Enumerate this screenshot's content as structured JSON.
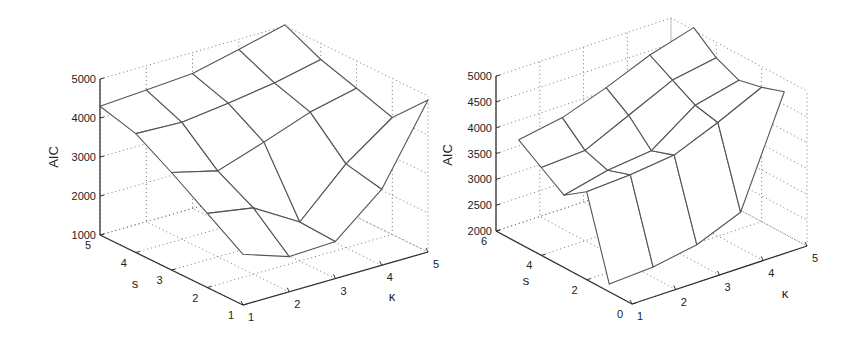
{
  "chart_data": [
    {
      "type": "surface3d",
      "title": "",
      "xlabel": "κ",
      "ylabel": "s",
      "zlabel": "AIC",
      "x": [
        1,
        2,
        3,
        4,
        5
      ],
      "y": [
        1,
        2,
        3,
        4,
        5
      ],
      "xlim": [
        1,
        5
      ],
      "ylim": [
        1,
        5
      ],
      "zlim": [
        1000,
        5000
      ],
      "x_ticks": [
        1,
        2,
        3,
        4,
        5
      ],
      "y_ticks": [
        1,
        2,
        3,
        4,
        5
      ],
      "z_ticks": [
        1000,
        2000,
        3000,
        4000,
        5000
      ],
      "grid": true,
      "z_values_by_s": [
        [
          2300,
          1900,
          1950,
          2950,
          4900
        ],
        [
          2900,
          2700,
          2000,
          3150,
          4000
        ],
        [
          3500,
          3200,
          3600,
          4030,
          4300
        ],
        [
          4050,
          4000,
          4150,
          4330,
          4590
        ],
        [
          4300,
          4380,
          4460,
          4740,
          5030
        ]
      ]
    },
    {
      "type": "surface3d",
      "title": "",
      "xlabel": "κ",
      "ylabel": "s",
      "zlabel": "AIC",
      "x": [
        1,
        2,
        3,
        4,
        5
      ],
      "y": [
        1,
        2,
        3,
        4,
        5
      ],
      "xlim": [
        1,
        5
      ],
      "ylim": [
        0,
        6
      ],
      "zlim": [
        2000,
        5000
      ],
      "x_ticks": [
        1,
        2,
        3,
        4,
        5
      ],
      "y_ticks": [
        0,
        2,
        4,
        6
      ],
      "z_ticks": [
        2000,
        2500,
        3000,
        3500,
        4000,
        4500,
        5000
      ],
      "grid": true,
      "z_values_by_s": [
        [
          2150,
          2200,
          2350,
          2700,
          4750
        ],
        [
          3700,
          3750,
          3850,
          4200,
          4600
        ],
        [
          3400,
          3600,
          3700,
          4300,
          4500
        ],
        [
          3700,
          3750,
          4150,
          4550,
          4700
        ],
        [
          4000,
          4150,
          4450,
          4800,
          5050
        ]
      ]
    }
  ],
  "left": {
    "z_axis_label": "AIC",
    "s_axis_label": "s",
    "k_axis_label": "κ",
    "z_tick_labels": [
      "1000",
      "2000",
      "3000",
      "4000",
      "5000"
    ],
    "s_tick_labels": [
      "1",
      "2",
      "3",
      "4",
      "5"
    ],
    "k_tick_labels": [
      "1",
      "2",
      "3",
      "4",
      "5"
    ]
  },
  "right": {
    "z_axis_label": "AIC",
    "s_axis_label": "s",
    "k_axis_label": "κ",
    "z_tick_labels": [
      "2000",
      "2500",
      "3000",
      "3500",
      "4000",
      "4500",
      "5000"
    ],
    "s_tick_labels": [
      "0",
      "2",
      "4",
      "6"
    ],
    "k_tick_labels": [
      "1",
      "2",
      "3",
      "4",
      "5"
    ]
  },
  "colors": {
    "background": "#ffffff",
    "axis": "#333333",
    "grid": "#777777",
    "surface_fill": "#ffffff",
    "surface_edge": "#555555"
  }
}
